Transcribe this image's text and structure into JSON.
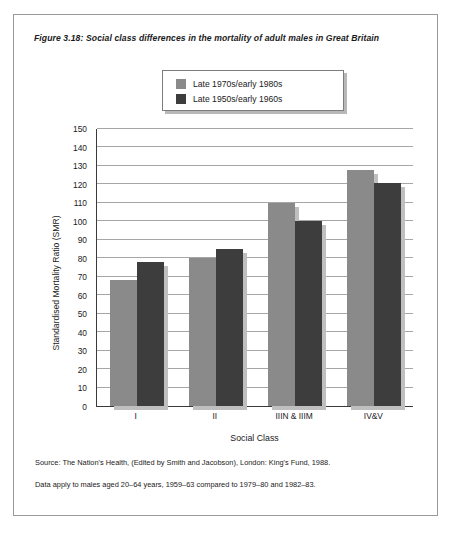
{
  "figure": {
    "number": "Figure 3.18:",
    "title": "Social class differences in the mortality of adult males in Great Britain"
  },
  "legend": {
    "items": [
      {
        "label": "Late 1970s/early 1980s",
        "color": "#8a8a8a"
      },
      {
        "label": "Late 1950s/early 1960s",
        "color": "#3d3d3d"
      }
    ]
  },
  "footnotes": [
    "Source: The Nation's Health, (Edited by Smith and Jacobson),  London: King's Fund, 1988.",
    "Data apply to males aged 20–64 years, 1959–63 compared to 1979–80 and 1982–83."
  ],
  "chart_data": {
    "type": "bar",
    "title": "Social class differences in the mortality of adult males in Great Britain",
    "xlabel": "Social Class",
    "ylabel": "Standardised Mortality Ratio (SMR)",
    "categories": [
      "I",
      "II",
      "IIIN & IIIM",
      "IV&V"
    ],
    "series": [
      {
        "name": "Late 1970s/early 1980s",
        "color": "#8a8a8a",
        "values": [
          68,
          80,
          110,
          128
        ]
      },
      {
        "name": "Late 1950s/early 1960s",
        "color": "#3d3d3d",
        "values": [
          78,
          85,
          100,
          121
        ]
      }
    ],
    "ylim": [
      0,
      150
    ],
    "ytick_step": 10,
    "yticks": [
      0,
      10,
      20,
      30,
      40,
      50,
      60,
      70,
      80,
      90,
      100,
      110,
      120,
      130,
      140,
      150
    ],
    "grid": "horizontal",
    "legend_position": "top-center"
  }
}
